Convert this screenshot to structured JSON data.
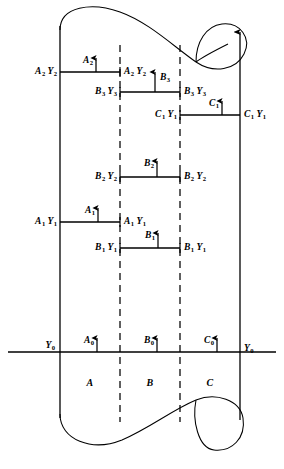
{
  "figure": {
    "background_color": "#ffffff",
    "line_color": "#000000",
    "width": 284,
    "height": 469
  },
  "geometry": {
    "left_rail_x": 60,
    "right_rail_x": 240,
    "dash_left_x": 120,
    "dash_right_x": 180,
    "axis_y": 352,
    "axis_x_start": 8,
    "axis_x_end": 276,
    "rail_top_y": 26,
    "rail_bottom_y": 418
  },
  "rows": [
    {
      "id": "a2",
      "y": 72,
      "x1": 60,
      "x2": 120,
      "left_label": "A2 Y2",
      "right_label": "A2 Y2",
      "arrow": {
        "label": "A2",
        "x": 96,
        "label_side": "left"
      }
    },
    {
      "id": "b3",
      "y": 92,
      "x1": 120,
      "x2": 180,
      "left_label": "B3 Y3",
      "right_label": "B3 Y3",
      "arrow": {
        "label": "B3",
        "x": 155,
        "label_side": "right"
      }
    },
    {
      "id": "c1",
      "y": 115,
      "x1": 180,
      "x2": 240,
      "left_label": "C1 Y1",
      "right_label": "C1 Y1",
      "arrow": {
        "label": "C1",
        "x": 222,
        "label_side": "left"
      }
    },
    {
      "id": "b2",
      "y": 177,
      "x1": 120,
      "x2": 180,
      "left_label": "B2 Y2",
      "right_label": "B2 Y2",
      "arrow": {
        "label": "B2",
        "x": 157,
        "label_side": "left"
      }
    },
    {
      "id": "a1",
      "y": 222,
      "x1": 60,
      "x2": 120,
      "left_label": "A1 Y1",
      "right_label": "A1 Y1",
      "arrow": {
        "label": "A1",
        "x": 98,
        "label_side": "left"
      }
    },
    {
      "id": "b1",
      "y": 248,
      "x1": 120,
      "x2": 180,
      "left_label": "B1 Y1",
      "right_label": "B1 Y1",
      "arrow": {
        "label": "B1",
        "x": 158,
        "label_side": "left"
      }
    }
  ],
  "axis": {
    "y": 352,
    "left_label": "Y0",
    "right_label": "Y0",
    "arrows": [
      {
        "label": "A0",
        "x": 97
      },
      {
        "label": "B0",
        "x": 157
      },
      {
        "label": "C0",
        "x": 217
      }
    ]
  },
  "regions": [
    {
      "label": "A",
      "x": 90,
      "y": 383
    },
    {
      "label": "B",
      "x": 150,
      "y": 383
    },
    {
      "label": "C",
      "x": 210,
      "y": 383
    }
  ],
  "subscript_labels": {
    "a2_y2": {
      "base": "A",
      "sub": "2",
      "base2": "Y",
      "sub2": "2"
    },
    "b3_y3": {
      "base": "B",
      "sub": "3",
      "base2": "Y",
      "sub2": "3"
    },
    "c1_y1": {
      "base": "C",
      "sub": "1",
      "base2": "Y",
      "sub2": "1"
    },
    "b2_y2": {
      "base": "B",
      "sub": "2",
      "base2": "Y",
      "sub2": "2"
    },
    "a1_y1": {
      "base": "A",
      "sub": "1",
      "base2": "Y",
      "sub2": "1"
    },
    "b1_y1": {
      "base": "B",
      "sub": "1",
      "base2": "Y",
      "sub2": "1"
    },
    "y0": {
      "base": "Y",
      "sub": "0"
    }
  }
}
